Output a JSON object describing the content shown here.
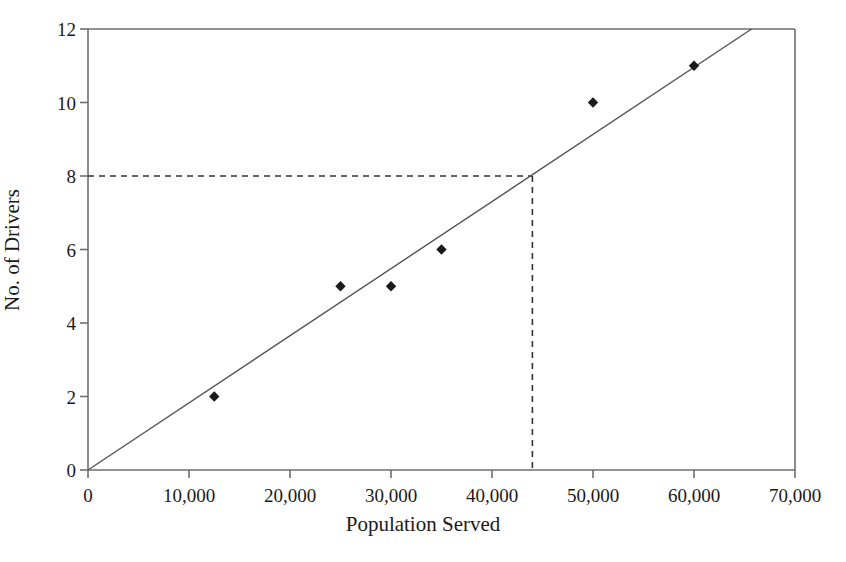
{
  "chart_data": {
    "type": "scatter",
    "title": "",
    "xlabel": "Population Served",
    "ylabel": "No. of Drivers",
    "xlim": [
      0,
      70000
    ],
    "ylim": [
      0,
      12
    ],
    "grid": false,
    "legend": "none",
    "x_ticks": [
      0,
      10000,
      20000,
      30000,
      40000,
      50000,
      60000,
      70000
    ],
    "x_tick_labels": [
      "0",
      "10,000",
      "20,000",
      "30,000",
      "40,000",
      "50,000",
      "60,000",
      "70,000"
    ],
    "y_ticks": [
      0,
      2,
      4,
      6,
      8,
      10,
      12
    ],
    "y_tick_labels": [
      "0",
      "2",
      "4",
      "6",
      "8",
      "10",
      "12"
    ],
    "series": [
      {
        "name": "Observed data",
        "marker": "diamond",
        "color": "#1a1a1a",
        "points": [
          {
            "x": 12500,
            "y": 2
          },
          {
            "x": 25000,
            "y": 5
          },
          {
            "x": 30000,
            "y": 5
          },
          {
            "x": 35000,
            "y": 6
          },
          {
            "x": 50000,
            "y": 10
          },
          {
            "x": 60000,
            "y": 11
          }
        ]
      }
    ],
    "trend_line": {
      "name": "Best fit line",
      "color": "#555555",
      "from": {
        "x": 0,
        "y": 0
      },
      "to": {
        "x": 65700,
        "y": 12
      }
    },
    "annotation_lines": {
      "name": "Projection guide",
      "style": "dashed",
      "color": "#333333",
      "horizontal_y": 8,
      "vertical_x": 44000,
      "from_x": 0,
      "to_y": 0
    }
  },
  "axis": {
    "x_title": "Population Served",
    "y_title": "No. of Drivers"
  }
}
